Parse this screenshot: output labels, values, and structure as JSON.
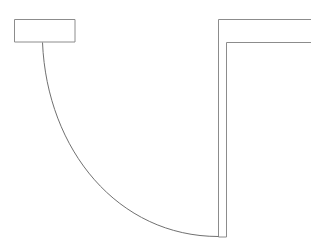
{
  "canvas": {
    "width": 323,
    "height": 249,
    "background_color": "#ffffff",
    "title": "Technical line drawing"
  },
  "style": {
    "line_color": "#8c8c8c",
    "arc_color": "#707070",
    "line_width": 1,
    "fill": "none"
  },
  "diagram": {
    "type": "2d-line-drawing",
    "shapes": [
      {
        "name": "left-block",
        "kind": "rectangle",
        "x": 14,
        "y": 19,
        "width": 61,
        "height": 23,
        "points": "14,19 75,19 75,42 14,42 14,19"
      },
      {
        "name": "right-outer-wall",
        "kind": "polyline",
        "points": "311,19 218,19 218,237"
      },
      {
        "name": "right-inner-wall",
        "kind": "polyline",
        "points": "311,42 226,42 226,237"
      },
      {
        "name": "wall-base-cap",
        "kind": "line",
        "points": "218,237 226,237"
      },
      {
        "name": "concave-arc",
        "kind": "arc",
        "start": [
          42,
          42
        ],
        "end": [
          218,
          237
        ],
        "control_points": [
          [
            48,
            150
          ],
          [
            120,
            237
          ]
        ],
        "path": "M 42,42 C 48,150 120,237 218,237",
        "note": "quarter-round concave fillet sweeping from block underside to channel base"
      }
    ]
  }
}
